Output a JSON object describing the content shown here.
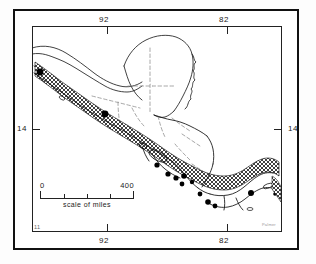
{
  "figure": {
    "type": "map",
    "region": "Central America",
    "style": "black-and-white line map, scanned halftone"
  },
  "graticule": {
    "top_labels": [
      {
        "text": "92",
        "position_pct": 30.0
      },
      {
        "text": "82",
        "position_pct": 78.0
      }
    ],
    "bottom_labels": [
      {
        "text": "92",
        "position_pct": 30.0
      },
      {
        "text": "82",
        "position_pct": 78.0
      }
    ],
    "left_labels": [
      {
        "text": "14",
        "position_pct": 50.0
      }
    ],
    "right_labels": [
      {
        "text": "14",
        "position_pct": 50.0
      }
    ],
    "corner_label": "11"
  },
  "scale": {
    "start_label": "0",
    "end_label": "400",
    "caption": "scale of miles",
    "divisions": 4
  },
  "legend_marks": {
    "site_dot": "filled-black-circle",
    "volcanic_belt": "cross-hatched-band",
    "border": "dashed-line"
  },
  "colors": {
    "ink": "#111111",
    "paper": "#ffffff",
    "hatch": "#333333",
    "border_dash": "#777777"
  },
  "signature": "Palmer"
}
